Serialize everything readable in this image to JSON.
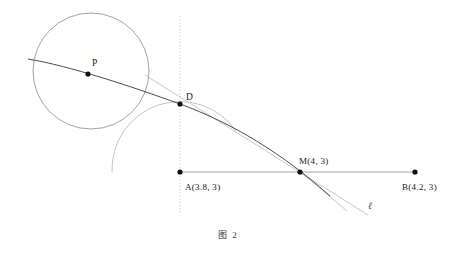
{
  "figure": {
    "caption": "图 2",
    "background_color": "#ffffff"
  },
  "colors": {
    "curve_dark": "#3a3a3a",
    "circle_stroke": "#8c8c8c",
    "arc_stroke": "#b0b0b0",
    "axis_stroke": "#9a9a9a",
    "dotted_stroke": "#bdbdbd",
    "tangent_stroke": "#c2c2c2",
    "point_fill": "#111111",
    "label_text": "#1a1a1a"
  },
  "points": [
    {
      "id": "P",
      "label": "P",
      "x": 88,
      "y": 74,
      "label_x": 92,
      "label_y": 66
    },
    {
      "id": "D",
      "label": "D",
      "x": 180,
      "y": 104,
      "label_x": 186,
      "label_y": 99
    },
    {
      "id": "A",
      "label": "A(3.8, 3)",
      "x": 180,
      "y": 172,
      "label_x": 185,
      "label_y": 189
    },
    {
      "id": "M",
      "label": "M(4, 3)",
      "x": 300,
      "y": 172,
      "label_x": 299,
      "label_y": 164
    },
    {
      "id": "B",
      "label": "B(4.2, 3)",
      "x": 415,
      "y": 172,
      "label_x": 404,
      "label_y": 189
    }
  ],
  "shapes": {
    "circle": {
      "cx": 91,
      "cy": 71,
      "r": 58
    },
    "arc_at_A": {
      "cx": 180,
      "cy": 172,
      "r": 68
    },
    "horizontal_segment": {
      "x1": 180,
      "y1": 172,
      "x2": 415,
      "y2": 172
    },
    "vertical_dotted": {
      "x": 180,
      "y1": 16,
      "y2": 214
    },
    "tangent_line": {
      "x1": 145,
      "y1": 75,
      "x2": 368,
      "y2": 215,
      "label": "ℓ",
      "label_x": 370,
      "label_y": 208
    },
    "secant_from_M": {
      "x1": 300,
      "y1": 172,
      "x2": 345,
      "y2": 210
    }
  },
  "curve": {
    "description": "dark-curve-through-P-D-M",
    "path": "M 28,59 C 70,66 130,86 180,104 C 232,123 282,153 330,196"
  },
  "labels": {
    "point_p": "P",
    "point_d": "D",
    "point_a": "A(3.8, 3)",
    "point_m": "M(4, 3)",
    "point_b": "B(4.2, 3)",
    "line_l": "ℓ",
    "caption": "图 2"
  }
}
